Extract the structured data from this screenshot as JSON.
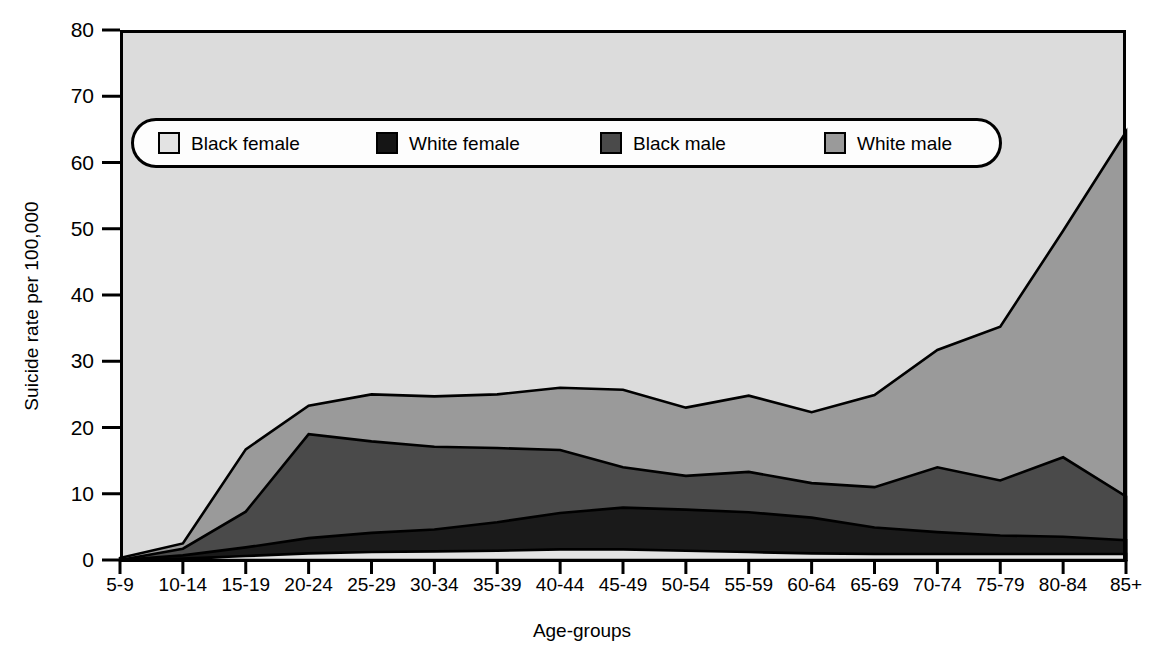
{
  "chart_data": {
    "type": "area",
    "stacked": true,
    "title": "",
    "xlabel": "Age-groups",
    "ylabel": "Suicide rate per 100,000",
    "categories": [
      "5-9",
      "10-14",
      "15-19",
      "20-24",
      "25-29",
      "30-34",
      "35-39",
      "40-44",
      "45-49",
      "50-54",
      "55-59",
      "60-64",
      "65-69",
      "70-74",
      "75-79",
      "80-84",
      "85+"
    ],
    "ylim": [
      0,
      80
    ],
    "yticks": [
      0,
      10,
      20,
      30,
      40,
      50,
      60,
      70,
      80
    ],
    "grid": false,
    "legend_position": "top-inside",
    "series": [
      {
        "name": "Black female",
        "color": "#e3e3e3",
        "values": [
          0.0,
          0.2,
          0.6,
          1.0,
          1.2,
          1.3,
          1.4,
          1.6,
          1.6,
          1.4,
          1.2,
          1.0,
          0.9,
          0.9,
          0.9,
          0.9,
          0.9
        ]
      },
      {
        "name": "White female",
        "color": "#1a1a1a",
        "values": [
          0.0,
          0.5,
          1.3,
          2.3,
          2.9,
          3.3,
          4.3,
          5.5,
          6.3,
          6.2,
          6.0,
          5.4,
          4.0,
          3.3,
          2.8,
          2.6,
          2.1
        ]
      },
      {
        "name": "Black male",
        "color": "#4a4a4a",
        "values": [
          0.0,
          1.0,
          5.4,
          15.7,
          13.8,
          12.5,
          11.2,
          9.5,
          6.1,
          5.1,
          6.1,
          5.2,
          6.1,
          9.8,
          8.3,
          12.0,
          6.6
        ]
      },
      {
        "name": "White male",
        "color": "#9a9a9a",
        "values": [
          0.3,
          0.8,
          9.4,
          4.3,
          7.1,
          7.6,
          8.1,
          9.4,
          11.7,
          10.3,
          11.5,
          10.7,
          13.9,
          17.7,
          23.2,
          34.2,
          55.0
        ]
      }
    ],
    "stack_tops": {
      "Black female": [
        0.0,
        0.2,
        0.6,
        1.0,
        1.2,
        1.3,
        1.4,
        1.6,
        1.6,
        1.4,
        1.2,
        1.0,
        0.9,
        0.9,
        0.9,
        0.9,
        0.9
      ],
      "White female": [
        0.0,
        0.7,
        1.9,
        3.3,
        4.1,
        4.6,
        5.7,
        7.1,
        7.9,
        7.6,
        7.2,
        6.4,
        4.9,
        4.2,
        3.7,
        3.5,
        3.0
      ],
      "Black male": [
        0.0,
        1.7,
        7.3,
        19.0,
        17.9,
        17.1,
        16.9,
        16.6,
        14.0,
        12.7,
        13.3,
        11.6,
        11.0,
        14.0,
        12.0,
        15.5,
        9.6
      ],
      "White male": [
        0.3,
        2.5,
        16.7,
        23.3,
        25.0,
        24.7,
        25.0,
        26.0,
        25.7,
        23.0,
        24.8,
        22.3,
        24.9,
        31.7,
        35.2,
        49.7,
        64.6
      ]
    }
  },
  "axes": {
    "y_tick_labels": [
      "80",
      "70",
      "60",
      "50",
      "40",
      "30",
      "20",
      "10",
      "0"
    ],
    "y_title": "Suicide rate per 100,000",
    "x_title": "Age-groups",
    "x_tick_labels": [
      "5-9",
      "10-14",
      "15-19",
      "20-24",
      "25-29",
      "30-34",
      "35-39",
      "40-44",
      "45-49",
      "50-54",
      "55-59",
      "60-64",
      "65-69",
      "70-74",
      "75-79",
      "80-84",
      "85+"
    ]
  },
  "legend": {
    "items": [
      {
        "label": "Black female",
        "color": "#e3e3e3"
      },
      {
        "label": "White female",
        "color": "#151515"
      },
      {
        "label": "Black male",
        "color": "#4a4a4a"
      },
      {
        "label": "White male",
        "color": "#9a9a9a"
      }
    ]
  },
  "colors": {
    "plot_background": "#dcdcdc",
    "axis_line": "#000000",
    "series_outline": "#000000"
  }
}
